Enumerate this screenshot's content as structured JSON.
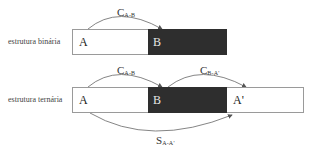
{
  "binary": {
    "label": "estrutura binária",
    "segments": [
      {
        "id": "A",
        "text": "A",
        "shaded": false
      },
      {
        "id": "B",
        "text": "B",
        "shaded": true
      }
    ],
    "relations": [
      {
        "main": "C",
        "sub": "A-B",
        "from": "A",
        "to": "B",
        "side": "top"
      }
    ]
  },
  "ternary": {
    "label": "estrutura ternária",
    "segments": [
      {
        "id": "A",
        "text": "A",
        "shaded": false
      },
      {
        "id": "B",
        "text": "B",
        "shaded": true
      },
      {
        "id": "A'",
        "text": "A'",
        "shaded": false
      }
    ],
    "relations": [
      {
        "main": "C",
        "sub": "A-B",
        "from": "A",
        "to": "B",
        "side": "top"
      },
      {
        "main": "C",
        "sub": "B-A'",
        "from": "B",
        "to": "A'",
        "side": "top"
      },
      {
        "main": "S",
        "sub": "A-A'",
        "from": "A",
        "to": "A'",
        "side": "bottom"
      }
    ]
  },
  "colors": {
    "shaded": "#2e2e2e",
    "border": "#9a9a9a",
    "arc": "#555555"
  }
}
